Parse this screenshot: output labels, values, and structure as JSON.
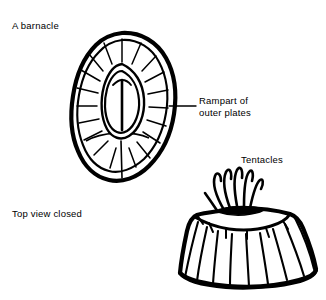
{
  "figure": {
    "title": "A barnacle",
    "background_color": "#ffffff",
    "ink_color": "#000000",
    "width": 326,
    "height": 300
  },
  "labels": {
    "barnacle": "A barnacle",
    "rampart_line1": "Rampart of",
    "rampart_line2": "outer plates",
    "tentacles": "Tentacles",
    "top_view": "Top view closed"
  },
  "views": {
    "top_view": {
      "caption": "Top view closed",
      "description": "oval barnacle shell seen from above with radiating outer plates and a central slit-shaped operculum",
      "callout": "Rampart of outer plates"
    },
    "side_view": {
      "description": "conical barnacle shell seen from the side with vertical wall plates and feeding tentacles emerging from the top opening",
      "callout": "Tentacles"
    }
  }
}
